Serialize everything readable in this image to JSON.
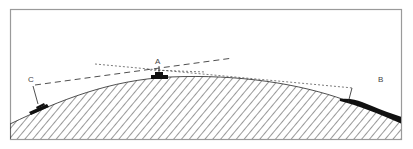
{
  "diagram": {
    "type": "line-of-sight cross-section",
    "labels": {
      "a": "A",
      "b": "B",
      "c": "C"
    },
    "colors": {
      "frame": "#9a9a9a",
      "ink": "#111111",
      "hatch": "#333333",
      "label": "#444444",
      "background": "#ffffff"
    },
    "elements": [
      {
        "id": "ground",
        "kind": "hatched-terrain",
        "description": "convex hill cross-section"
      },
      {
        "id": "vehicle-a",
        "kind": "vehicle",
        "label": "A",
        "position": "hill crest"
      },
      {
        "id": "vehicle-c",
        "kind": "vehicle",
        "label": "C",
        "position": "left slope"
      },
      {
        "id": "terrain-b",
        "kind": "dark-terrain",
        "label": "B",
        "position": "right slope"
      },
      {
        "id": "sightline-c-a",
        "kind": "long-dashed-line",
        "from": "C",
        "to": "past A"
      },
      {
        "id": "sightline-a-b",
        "kind": "short-dashed-line",
        "from": "left of A",
        "to": "B"
      }
    ]
  }
}
